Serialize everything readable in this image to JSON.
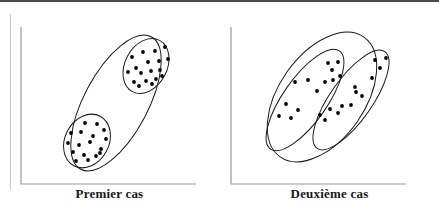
{
  "figure": {
    "background_color": "#ffffff",
    "line_color": "#1a1a1a",
    "dot_color": "#000000",
    "top_rule_color": "#4a4a4a",
    "left_rule_color": "#c9c9c9"
  },
  "panels": [
    {
      "id": "premier-cas",
      "caption": "Premier cas",
      "axis": {
        "x": 21,
        "y_top": 27,
        "y_bottom": 184,
        "x_right": 196
      },
      "outer_ellipse": {
        "cx": 116,
        "cy": 103,
        "rx": 32,
        "ry": 75,
        "rotation": 28
      },
      "clusters": [
        {
          "id": "upper-cluster",
          "ellipse": {
            "cx": 146,
            "cy": 66,
            "rx": 21,
            "ry": 29,
            "rotation": 28
          },
          "points": [
            [
              132,
              57
            ],
            [
              143,
              52
            ],
            [
              155,
              51
            ],
            [
              165,
              47
            ],
            [
              136,
              68
            ],
            [
              148,
              62
            ],
            [
              159,
              61
            ],
            [
              168,
              59
            ],
            [
              128,
              72
            ],
            [
              141,
              73
            ],
            [
              151,
              71
            ],
            [
              160,
              70
            ],
            [
              134,
              82
            ],
            [
              146,
              81
            ],
            [
              156,
              79
            ],
            [
              152,
              84
            ],
            [
              139,
              86
            ],
            [
              162,
              76
            ]
          ]
        },
        {
          "id": "lower-cluster",
          "ellipse": {
            "cx": 87,
            "cy": 141,
            "rx": 22,
            "ry": 28,
            "rotation": 28
          },
          "points": [
            [
              85,
              123
            ],
            [
              97,
              124
            ],
            [
              104,
              130
            ],
            [
              71,
              133
            ],
            [
              81,
              132
            ],
            [
              93,
              136
            ],
            [
              106,
              139
            ],
            [
              68,
              143
            ],
            [
              79,
              145
            ],
            [
              90,
              142
            ],
            [
              101,
              149
            ],
            [
              73,
              152
            ],
            [
              84,
              155
            ],
            [
              96,
              156
            ],
            [
              76,
              161
            ],
            [
              88,
              160
            ],
            [
              100,
              153
            ]
          ]
        }
      ]
    },
    {
      "id": "deuxieme-cas",
      "caption": "Deuxième cas",
      "axis": {
        "x": 11,
        "y_top": 27,
        "y_bottom": 184,
        "x_right": 186
      },
      "outer_ellipse": {
        "cx": 102,
        "cy": 97,
        "rx": 43,
        "ry": 73,
        "rotation": 35
      },
      "clusters": [
        {
          "id": "left-cluster",
          "ellipse": {
            "cx": 85,
            "cy": 100,
            "rx": 22,
            "ry": 60,
            "rotation": 35
          },
          "points": [
            [
              108,
              63
            ],
            [
              118,
              62
            ],
            [
              112,
              70
            ],
            [
              120,
              76
            ],
            [
              113,
              80
            ],
            [
              88,
              80
            ],
            [
              105,
              82
            ],
            [
              75,
              82
            ],
            [
              97,
              91
            ],
            [
              66,
              104
            ],
            [
              78,
              110
            ],
            [
              59,
              116
            ],
            [
              71,
              118
            ]
          ]
        },
        {
          "id": "right-cluster",
          "ellipse": {
            "cx": 131,
            "cy": 100,
            "rx": 21,
            "ry": 59,
            "rotation": 35
          },
          "points": [
            [
              155,
              60
            ],
            [
              166,
              58
            ],
            [
              160,
              68
            ],
            [
              152,
              78
            ],
            [
              135,
              87
            ],
            [
              136,
              92
            ],
            [
              142,
              96
            ],
            [
              110,
              109
            ],
            [
              122,
              106
            ],
            [
              131,
              105
            ],
            [
              118,
              113
            ],
            [
              100,
              115
            ],
            [
              105,
              120
            ]
          ]
        }
      ]
    }
  ]
}
